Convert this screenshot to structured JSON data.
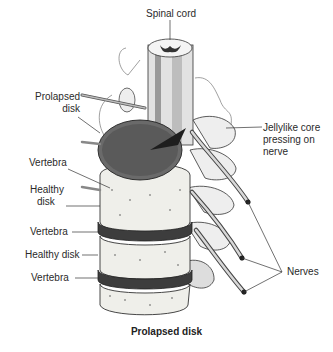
{
  "diagram": {
    "title": "Prolapsed disk",
    "labels": {
      "spinal_cord": "Spinal cord",
      "prolapsed_disk": [
        "Prolapsed",
        "disk"
      ],
      "jellylike_core": [
        "Jellylike core",
        "pressing on",
        "nerve"
      ],
      "vertebra_1": "Vertebra",
      "healthy_disk_1": [
        "Healthy",
        "disk"
      ],
      "vertebra_2": "Vertebra",
      "healthy_disk_2": "Healthy disk",
      "vertebra_3": "Vertebra",
      "nerves": "Nerves"
    },
    "colors": {
      "background": "#ffffff",
      "ink": "#222222",
      "disk_dark": "#4a4a4a",
      "bone": "#efefea"
    }
  }
}
